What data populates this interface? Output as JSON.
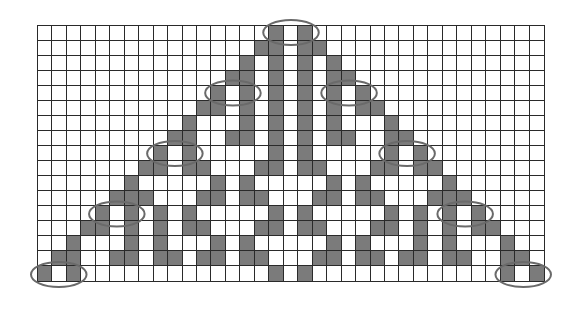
{
  "figure": {
    "description": "Cellular automaton triangle pattern on a square grid with circled cell pairs",
    "grid": {
      "columns": 35,
      "rows": 17,
      "left": 37,
      "top": 25,
      "width": 508,
      "height": 257,
      "colors": {
        "filled": "#7b7b7b",
        "empty": "#ffffff",
        "lines": "#2a2a2a",
        "oval": "#6a6a6a"
      },
      "filled_cells_by_row": [
        [
          16,
          18
        ],
        [
          15,
          16,
          18,
          19
        ],
        [
          14,
          16,
          18,
          20
        ],
        [
          13,
          14,
          16,
          18,
          20,
          21
        ],
        [
          12,
          14,
          16,
          18,
          20,
          22
        ],
        [
          11,
          12,
          14,
          16,
          18,
          20,
          22,
          23
        ],
        [
          10,
          14,
          16,
          18,
          20,
          24
        ],
        [
          9,
          10,
          13,
          14,
          16,
          18,
          20,
          21,
          24,
          25
        ],
        [
          8,
          10,
          16,
          18,
          24,
          26
        ],
        [
          7,
          8,
          10,
          11,
          15,
          16,
          18,
          19,
          23,
          24,
          26,
          27
        ],
        [
          6,
          12,
          14,
          20,
          22,
          28
        ],
        [
          5,
          6,
          7,
          11,
          12,
          14,
          15,
          19,
          20,
          22,
          23,
          27,
          28,
          29
        ],
        [
          4,
          6,
          8,
          10,
          16,
          18,
          24,
          26,
          28,
          30
        ],
        [
          3,
          4,
          6,
          8,
          10,
          11,
          15,
          16,
          18,
          19,
          23,
          24,
          26,
          28,
          30,
          31
        ],
        [
          2,
          6,
          8,
          12,
          14,
          20,
          22,
          26,
          28,
          32
        ],
        [
          1,
          2,
          5,
          6,
          8,
          9,
          11,
          12,
          14,
          15,
          19,
          20,
          22,
          23,
          25,
          26,
          28,
          29,
          32,
          33
        ],
        [
          0,
          2,
          16,
          18,
          32,
          34
        ]
      ]
    },
    "ovals": [
      {
        "row": 0,
        "col_start": 16,
        "col_end": 18
      },
      {
        "row": 4,
        "col_start": 12,
        "col_end": 14
      },
      {
        "row": 4,
        "col_start": 20,
        "col_end": 22
      },
      {
        "row": 8,
        "col_start": 8,
        "col_end": 10
      },
      {
        "row": 8,
        "col_start": 24,
        "col_end": 26
      },
      {
        "row": 12,
        "col_start": 4,
        "col_end": 6
      },
      {
        "row": 12,
        "col_start": 28,
        "col_end": 30
      },
      {
        "row": 16,
        "col_start": 0,
        "col_end": 2
      },
      {
        "row": 16,
        "col_start": 32,
        "col_end": 34
      }
    ]
  }
}
